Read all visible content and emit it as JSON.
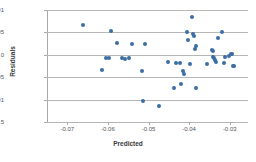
{
  "chart_data": {
    "type": "scatter",
    "title": "",
    "xlabel": "Predicted",
    "ylabel": "Residuals",
    "xlim": [
      -0.075,
      -0.0255
    ],
    "ylim": [
      -0.015,
      0.01
    ],
    "xticks": [
      -0.07,
      -0.06,
      -0.05,
      -0.04,
      -0.03
    ],
    "xtick_labels": [
      "-0.07",
      "-0.06",
      "-0.05",
      "-0.04",
      "-0.03"
    ],
    "yticks": [
      0.01,
      0.005,
      0,
      -0.005,
      -0.01,
      -0.015
    ],
    "ytick_labels": [
      "0.01",
      "0.005",
      "0",
      "-0.005",
      "-0.01",
      "-0.015"
    ],
    "grid": "horizontal",
    "legend": "none",
    "marker_color": "#3b6ea5",
    "gridline_color": "#b6b6b6",
    "background_color": "#ffffff",
    "series": [
      {
        "name": "Residuals",
        "points": [
          [
            -0.0662,
            0.0067
          ],
          [
            -0.0615,
            -0.0033
          ],
          [
            -0.0605,
            -0.0008
          ],
          [
            -0.0597,
            -0.0007
          ],
          [
            -0.0592,
            0.0053
          ],
          [
            -0.0578,
            0.0027
          ],
          [
            -0.0566,
            -0.0007
          ],
          [
            -0.0558,
            -0.0009
          ],
          [
            -0.0548,
            -0.0008
          ],
          [
            -0.054,
            0.0023
          ],
          [
            -0.0516,
            -0.0037
          ],
          [
            -0.0513,
            -0.0103
          ],
          [
            -0.0508,
            0.0024
          ],
          [
            -0.0473,
            -0.0114
          ],
          [
            -0.0452,
            -0.0017
          ],
          [
            -0.0437,
            -0.0074
          ],
          [
            -0.0432,
            -0.0018
          ],
          [
            -0.0423,
            -0.0019
          ],
          [
            -0.0419,
            -0.0065
          ],
          [
            -0.0415,
            -0.0037
          ],
          [
            -0.0413,
            -0.0042
          ],
          [
            -0.0404,
            0.005
          ],
          [
            -0.0403,
            0.0034
          ],
          [
            -0.0399,
            -0.0021
          ],
          [
            -0.0392,
            0.0085
          ],
          [
            -0.039,
            0.0046
          ],
          [
            -0.0387,
            0.0042
          ],
          [
            -0.0386,
            0.0013
          ],
          [
            -0.0384,
            0.002
          ],
          [
            -0.0382,
            -0.0073
          ],
          [
            -0.0356,
            -0.0021
          ],
          [
            -0.0344,
            0.0011
          ],
          [
            -0.0342,
            0.0008
          ],
          [
            -0.034,
            -0.0004
          ],
          [
            -0.0338,
            -0.0008
          ],
          [
            -0.0336,
            -0.0012
          ],
          [
            -0.0334,
            -0.0016
          ],
          [
            -0.033,
            0.0038
          ],
          [
            -0.0318,
            0.0051
          ],
          [
            -0.0314,
            -0.0019
          ],
          [
            -0.0311,
            -0.0005
          ],
          [
            -0.0303,
            -0.0003
          ],
          [
            -0.0296,
            0.0002
          ],
          [
            -0.0294,
            0.0002
          ],
          [
            -0.0293,
            -0.0024
          ],
          [
            -0.0289,
            -0.0026
          ]
        ]
      }
    ]
  }
}
